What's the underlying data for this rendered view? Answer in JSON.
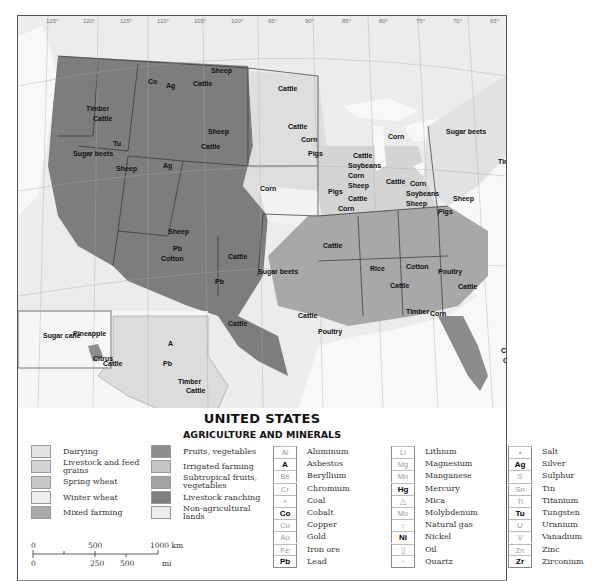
{
  "title": "UNITED STATES",
  "subtitle": "AGRICULTURE AND MINERALS",
  "land_use_legend": [
    {
      "label": "Dairying",
      "color": "#e4e4e4"
    },
    {
      "label": "Livestock and feed grains",
      "color": "#d4d4d4"
    },
    {
      "label": "Spring wheat",
      "color": "#c6c6c6"
    },
    {
      "label": "Winter wheat",
      "color": "#efefef"
    },
    {
      "label": "Mixed farming",
      "color": "#a9a9a9"
    },
    {
      "label": "Fruits, vegetables",
      "color": "#8e8e8e"
    },
    {
      "label": "Irrigated farming",
      "color": "#c4c4c4"
    },
    {
      "label": "Subtropical fruits, vegetables",
      "color": "#a3a3a3"
    },
    {
      "label": "Livestock ranching",
      "color": "#7f7f7f"
    },
    {
      "label": "Non-agricultural lands",
      "color": "#ededed"
    }
  ],
  "minerals_legend": [
    {
      "symbol": "Al",
      "label": "Aluminum",
      "bold": false
    },
    {
      "symbol": "A",
      "label": "Asbestos",
      "bold": true
    },
    {
      "symbol": "Be",
      "label": "Beryllium",
      "bold": false
    },
    {
      "symbol": "Cr",
      "label": "Chromium",
      "bold": false
    },
    {
      "symbol": "+",
      "label": "Coal",
      "bold": false
    },
    {
      "symbol": "Co",
      "label": "Cobalt",
      "bold": true
    },
    {
      "symbol": "Cu",
      "label": "Copper",
      "bold": false
    },
    {
      "symbol": "Au",
      "label": "Gold",
      "bold": false
    },
    {
      "symbol": "Fe",
      "label": "Iron ore",
      "bold": false
    },
    {
      "symbol": "Pb",
      "label": "Lead",
      "bold": true
    },
    {
      "symbol": "Li",
      "label": "Lithium",
      "bold": false
    },
    {
      "symbol": "Mg",
      "label": "Magnesium",
      "bold": false
    },
    {
      "symbol": "Mn",
      "label": "Manganese",
      "bold": false
    },
    {
      "symbol": "Hg",
      "label": "Mercury",
      "bold": true
    },
    {
      "symbol": "△",
      "label": "Mica",
      "bold": false
    },
    {
      "symbol": "Mo",
      "label": "Molybdenum",
      "bold": false
    },
    {
      "symbol": "○",
      "label": "Natural gas",
      "bold": false
    },
    {
      "symbol": "Ni",
      "label": "Nickel",
      "bold": true
    },
    {
      "symbol": "▯",
      "label": "Oil",
      "bold": false
    },
    {
      "symbol": "▫",
      "label": "Quartz",
      "bold": false
    },
    {
      "symbol": "•",
      "label": "Salt",
      "bold": false
    },
    {
      "symbol": "Ag",
      "label": "Silver",
      "bold": true
    },
    {
      "symbol": "S",
      "label": "Sulphur",
      "bold": false
    },
    {
      "symbol": "Sn",
      "label": "Tin",
      "bold": false
    },
    {
      "symbol": "Ti",
      "label": "Titanium",
      "bold": false
    },
    {
      "symbol": "Tu",
      "label": "Tungsten",
      "bold": true
    },
    {
      "symbol": "U",
      "label": "Uranium",
      "bold": false
    },
    {
      "symbol": "V",
      "label": "Vanadium",
      "bold": false
    },
    {
      "symbol": "Zn",
      "label": "Zinc",
      "bold": false
    },
    {
      "symbol": "Zr",
      "label": "Zirconium",
      "bold": true
    }
  ],
  "scale": {
    "km_ticks": [
      "0",
      "500",
      "1000 km"
    ],
    "mi_ticks": [
      "0",
      "250",
      "500",
      "mi"
    ]
  },
  "map": {
    "longitudes_top": [
      "125°",
      "120°",
      "115°",
      "110°",
      "105°",
      "100°",
      "95°",
      "90°",
      "85°",
      "80°",
      "75°",
      "70°",
      "65°"
    ],
    "longitudes_bottom": [
      "170°",
      "110°",
      "100°",
      "95°",
      "90°",
      "85°",
      "80°",
      "75°"
    ],
    "latitudes": [
      "45°",
      "40°",
      "35°",
      "30°",
      "25°"
    ],
    "region_labels": [
      {
        "text": "Timber",
        "x": 68,
        "y": 95
      },
      {
        "text": "Cattle",
        "x": 75,
        "y": 105
      },
      {
        "text": "Sheep",
        "x": 193,
        "y": 57
      },
      {
        "text": "Cattle",
        "x": 175,
        "y": 70
      },
      {
        "text": "Co",
        "x": 130,
        "y": 68
      },
      {
        "text": "Ag",
        "x": 148,
        "y": 72
      },
      {
        "text": "Cattle",
        "x": 260,
        "y": 75
      },
      {
        "text": "Cattle",
        "x": 270,
        "y": 113
      },
      {
        "text": "Corn",
        "x": 283,
        "y": 126
      },
      {
        "text": "Pigs",
        "x": 290,
        "y": 140
      },
      {
        "text": "Sheep",
        "x": 190,
        "y": 118
      },
      {
        "text": "Cattle",
        "x": 183,
        "y": 133
      },
      {
        "text": "Sugar beets",
        "x": 55,
        "y": 140
      },
      {
        "text": "Sheep",
        "x": 98,
        "y": 155
      },
      {
        "text": "Tu",
        "x": 95,
        "y": 130
      },
      {
        "text": "Ag",
        "x": 145,
        "y": 152
      },
      {
        "text": "Corn",
        "x": 242,
        "y": 175
      },
      {
        "text": "Cattle",
        "x": 335,
        "y": 142
      },
      {
        "text": "Soybeans",
        "x": 330,
        "y": 152
      },
      {
        "text": "Corn",
        "x": 330,
        "y": 162
      },
      {
        "text": "Sheep",
        "x": 330,
        "y": 172
      },
      {
        "text": "Cattle",
        "x": 368,
        "y": 168
      },
      {
        "text": "Corn",
        "x": 370,
        "y": 123
      },
      {
        "text": "Sugar beets",
        "x": 428,
        "y": 118
      },
      {
        "text": "Corn",
        "x": 392,
        "y": 170
      },
      {
        "text": "Soybeans",
        "x": 388,
        "y": 180
      },
      {
        "text": "Sheep",
        "x": 388,
        "y": 190
      },
      {
        "text": "Pigs",
        "x": 420,
        "y": 198
      },
      {
        "text": "Sheep",
        "x": 435,
        "y": 185
      },
      {
        "text": "Timber",
        "x": 490,
        "y": 72
      },
      {
        "text": "Timber",
        "x": 480,
        "y": 148
      },
      {
        "text": "Pigs",
        "x": 310,
        "y": 178
      },
      {
        "text": "Cattle",
        "x": 330,
        "y": 185
      },
      {
        "text": "Corn",
        "x": 320,
        "y": 195
      },
      {
        "text": "Sheep",
        "x": 150,
        "y": 218
      },
      {
        "text": "Cotton",
        "x": 143,
        "y": 245
      },
      {
        "text": "Pb",
        "x": 155,
        "y": 235
      },
      {
        "text": "Cattle",
        "x": 210,
        "y": 243
      },
      {
        "text": "Pb",
        "x": 197,
        "y": 268
      },
      {
        "text": "Cattle",
        "x": 305,
        "y": 232
      },
      {
        "text": "Sugar beets",
        "x": 240,
        "y": 258
      },
      {
        "text": "Cattle",
        "x": 210,
        "y": 310
      },
      {
        "text": "Cattle",
        "x": 280,
        "y": 302
      },
      {
        "text": "Poultry",
        "x": 300,
        "y": 318
      },
      {
        "text": "Rice",
        "x": 352,
        "y": 255
      },
      {
        "text": "Cattle",
        "x": 372,
        "y": 272
      },
      {
        "text": "Cotton",
        "x": 388,
        "y": 253
      },
      {
        "text": "Poultry",
        "x": 420,
        "y": 258
      },
      {
        "text": "Cattle",
        "x": 440,
        "y": 273
      },
      {
        "text": "Poultry",
        "x": 488,
        "y": 232
      },
      {
        "text": "Timber",
        "x": 388,
        "y": 298
      },
      {
        "text": "Corn",
        "x": 412,
        "y": 300
      },
      {
        "text": "Cattle",
        "x": 483,
        "y": 337
      },
      {
        "text": "Citrus",
        "x": 485,
        "y": 347
      },
      {
        "text": "Timber",
        "x": 160,
        "y": 368
      },
      {
        "text": "Cattle",
        "x": 168,
        "y": 377
      },
      {
        "text": "A",
        "x": 150,
        "y": 330
      },
      {
        "text": "Pb",
        "x": 145,
        "y": 350
      },
      {
        "text": "Pineapple",
        "x": 55,
        "y": 320
      },
      {
        "text": "Sugar cane",
        "x": 25,
        "y": 322
      },
      {
        "text": "Citrus",
        "x": 75,
        "y": 345
      },
      {
        "text": "Cattle",
        "x": 85,
        "y": 350
      }
    ],
    "hawaii_scale": {
      "km": [
        "0",
        "100",
        "200 km"
      ],
      "mi": [
        "0",
        "100",
        "mi"
      ]
    },
    "alaska_scale": {
      "km": [
        "0",
        "500",
        "1000 km"
      ],
      "mi": [
        "0",
        "250",
        "500",
        "mi"
      ]
    }
  }
}
